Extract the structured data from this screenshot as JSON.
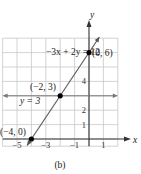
{
  "chart_data": {
    "type": "line",
    "caption": "(b)",
    "xlabel": "x",
    "ylabel": "y",
    "xlim": [
      -6,
      2
    ],
    "ylim": [
      -0.5,
      7
    ],
    "grid": true,
    "x_tick_labels": [
      "-5",
      "-3",
      "-1",
      "1"
    ],
    "x_ticks": [
      -5,
      -3,
      -1,
      1
    ],
    "y_tick_labels": [
      "1",
      "2",
      "4"
    ],
    "y_ticks": [
      1,
      2,
      4
    ],
    "series": [
      {
        "name": "-3x + 2y = 12",
        "label": "−3x + 2y = 12",
        "type": "line",
        "slope": 1.5,
        "intercept": 6,
        "points": [
          {
            "x": -4,
            "y": 0
          },
          {
            "x": 0,
            "y": 6
          }
        ]
      },
      {
        "name": "y = 3",
        "label": "y = 3",
        "type": "horizontal-line",
        "y": 3
      }
    ],
    "annotations": [
      {
        "text": "(0, 6)",
        "x": 0,
        "y": 6
      },
      {
        "text": "(−2, 3)",
        "x": -2,
        "y": 3
      },
      {
        "text": "(−4, 0)",
        "x": -4,
        "y": 0
      }
    ],
    "colors": {
      "grid": "#c8c8c8",
      "axis": "#333333",
      "line": "#555555",
      "horizontal_line": "#777777",
      "point": "#000000"
    }
  }
}
